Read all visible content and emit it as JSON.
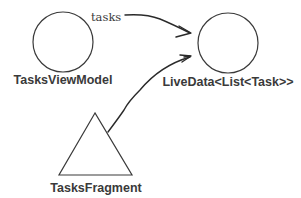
{
  "diagram": {
    "nodes": [
      {
        "id": "tasks-view-model",
        "shape": "circle",
        "label": "TasksViewModel"
      },
      {
        "id": "live-data",
        "shape": "circle",
        "label": "LiveData<List<Task>>"
      },
      {
        "id": "tasks-fragment",
        "shape": "triangle",
        "label": "TasksFragment"
      }
    ],
    "edges": [
      {
        "from": "tasks-view-model",
        "to": "live-data",
        "label": "tasks"
      },
      {
        "from": "tasks-fragment",
        "to": "live-data",
        "label": ""
      }
    ],
    "colors": {
      "stroke": "#3a3a3a",
      "text": "#3a3a3a",
      "background": "#ffffff"
    }
  }
}
